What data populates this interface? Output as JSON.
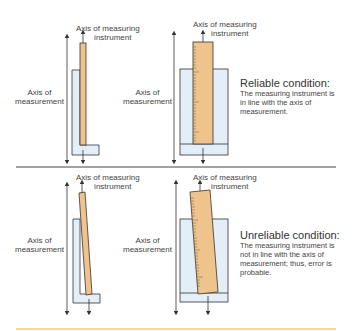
{
  "colors": {
    "ruler_fill": "#eec48c",
    "holder_fill": "#e3eef7",
    "outline": "#333333",
    "divider": "#444444",
    "bottom_rule": "#f6d98a"
  },
  "labels": {
    "instrument_axis": "Axis of measuring",
    "instrument_axis_2": "instrument",
    "measurement_axis": "Axis of",
    "measurement_axis_2": "measurement"
  },
  "panels": [
    {
      "condition": "reliable",
      "heading": "Reliable condition:",
      "description": "The measuring instrument is in line with the axis of measurement."
    },
    {
      "condition": "unreliable",
      "heading": "Unreliable condition:",
      "description": "The measuring instrument is not in line with the axis of measurement; thus, error is probable."
    }
  ]
}
